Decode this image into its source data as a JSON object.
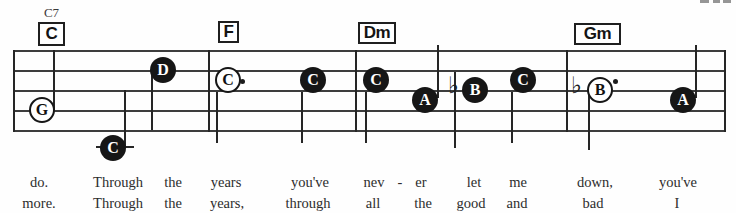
{
  "staff": {
    "x1": 13,
    "x2": 725,
    "line_ys": [
      50,
      70,
      90,
      110,
      130
    ],
    "barline_xs": [
      13,
      208,
      355,
      566,
      724
    ]
  },
  "chords": [
    {
      "label": "C",
      "superscript": "C7",
      "x": 38,
      "y": 22,
      "w": 27,
      "h": 24
    },
    {
      "label": "F",
      "x": 218,
      "y": 21,
      "w": 21,
      "h": 22
    },
    {
      "label": "Dm",
      "x": 358,
      "y": 22,
      "w": 38,
      "h": 22
    },
    {
      "label": "Gm",
      "x": 574,
      "y": 23,
      "w": 47,
      "h": 22
    }
  ],
  "flat_symbol": "♭",
  "notes": [
    {
      "letter": "G",
      "x": 42,
      "y": 110,
      "filled": false
    },
    {
      "letter": "C",
      "x": 113,
      "y": 148,
      "filled": true
    },
    {
      "letter": "D",
      "x": 163,
      "y": 70,
      "filled": true
    },
    {
      "letter": "C",
      "x": 228,
      "y": 80,
      "filled": false,
      "dot": [
        240,
        79
      ]
    },
    {
      "letter": "C",
      "x": 313,
      "y": 80,
      "filled": true
    },
    {
      "letter": "C",
      "x": 376,
      "y": 80,
      "filled": true
    },
    {
      "letter": "A",
      "x": 425,
      "y": 100,
      "filled": true
    },
    {
      "letter": "B",
      "x": 475,
      "y": 90,
      "filled": true,
      "flat": [
        448,
        74
      ]
    },
    {
      "letter": "C",
      "x": 523,
      "y": 80,
      "filled": true
    },
    {
      "letter": "B",
      "x": 600,
      "y": 90,
      "filled": false,
      "flat": [
        571,
        74
      ],
      "dot": [
        613,
        79
      ]
    },
    {
      "letter": "A",
      "x": 683,
      "y": 100,
      "filled": true
    }
  ],
  "stems": [
    [
      53,
      50,
      110
    ],
    [
      124,
      90,
      146
    ],
    [
      151,
      70,
      130
    ],
    [
      216,
      92,
      143
    ],
    [
      301,
      92,
      143
    ],
    [
      365,
      92,
      143
    ],
    [
      437,
      45,
      98
    ],
    [
      454,
      72,
      148
    ],
    [
      511,
      92,
      143
    ],
    [
      588,
      95,
      150
    ],
    [
      695,
      45,
      98
    ]
  ],
  "ledger_lines": [
    [
      96,
      146,
      38
    ]
  ],
  "lyrics": {
    "rows_y": [
      175,
      196
    ],
    "row1": [
      [
        "do.",
        39
      ],
      [
        "Through",
        118
      ],
      [
        "the",
        173
      ],
      [
        "years",
        226
      ],
      [
        "you've",
        310
      ],
      [
        "nev",
        374
      ],
      [
        "-",
        400
      ],
      [
        "er",
        421
      ],
      [
        "let",
        474
      ],
      [
        "me",
        518
      ],
      [
        "down,",
        595
      ],
      [
        "you've",
        678
      ]
    ],
    "row2": [
      [
        "more.",
        39
      ],
      [
        "Through",
        118
      ],
      [
        "the",
        173
      ],
      [
        "years,",
        227
      ],
      [
        "through",
        308
      ],
      [
        "all",
        373
      ],
      [
        "the",
        423
      ],
      [
        "good",
        471
      ],
      [
        "and",
        517
      ],
      [
        "bad",
        593
      ],
      [
        "I",
        677
      ]
    ]
  },
  "scan_artifacts": {
    "corner_marks": [
      [
        700,
        0,
        9,
        3
      ],
      [
        713,
        0,
        7,
        3
      ],
      [
        723,
        0,
        8,
        3
      ]
    ]
  }
}
